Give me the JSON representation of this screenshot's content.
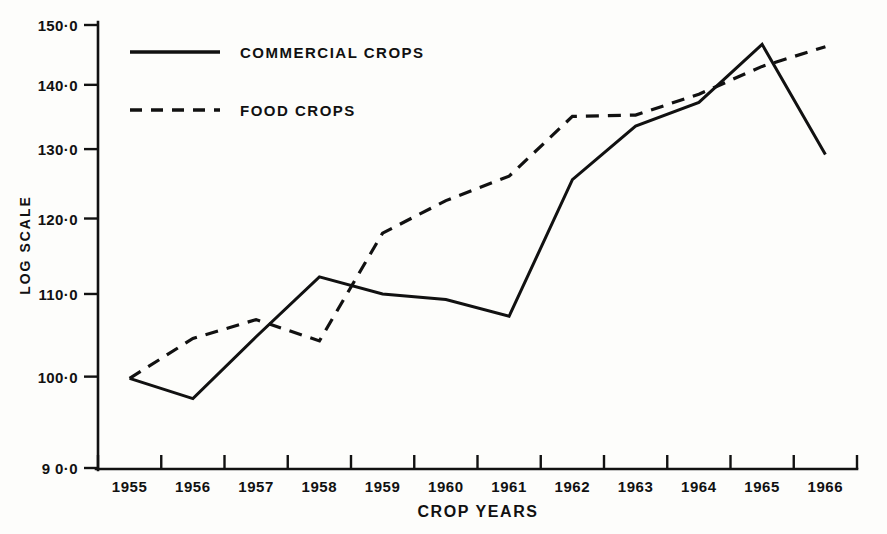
{
  "chart_data": {
    "type": "line",
    "title": "",
    "xlabel": "CROP YEARS",
    "ylabel": "LOG SCALE",
    "scale": "log",
    "grid": false,
    "legend_position": "top-left-inside",
    "categories": [
      "1955",
      "1956",
      "1957",
      "1958",
      "1959",
      "1960",
      "1961",
      "1962",
      "1963",
      "1964",
      "1965",
      "1966"
    ],
    "ylim": [
      90.0,
      150.0
    ],
    "ytick_labels": [
      "150·0",
      "140·0",
      "130·0",
      "120·0",
      "110·0",
      "100·0",
      "9 0·0"
    ],
    "ytick_values": [
      150.0,
      140.0,
      130.0,
      120.0,
      110.0,
      100.0,
      90.0
    ],
    "series": [
      {
        "name": "COMMERCIAL CROPS",
        "style": "solid",
        "color": "#111111",
        "values": [
          99.8,
          97.5,
          104.7,
          112.2,
          110.0,
          109.3,
          107.2,
          125.5,
          133.5,
          137.2,
          146.7,
          129.2
        ]
      },
      {
        "name": "FOOD CROPS",
        "style": "dashed",
        "color": "#111111",
        "values": [
          99.8,
          104.5,
          106.8,
          104.2,
          118.0,
          122.5,
          126.0,
          135.0,
          135.2,
          138.5,
          143.0,
          146.3
        ]
      }
    ]
  },
  "legend": {
    "items": [
      {
        "label": "COMMERCIAL CROPS",
        "style": "solid"
      },
      {
        "label": "FOOD CROPS",
        "style": "dashed"
      }
    ]
  },
  "axes": {
    "y_title": "LOG SCALE",
    "x_title": "CROP YEARS"
  }
}
